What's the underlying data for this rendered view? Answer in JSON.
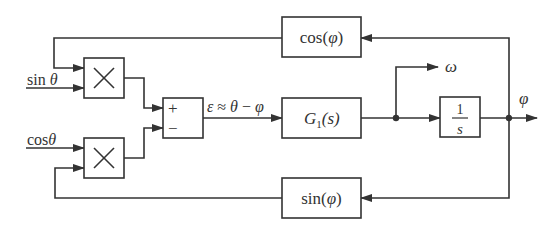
{
  "diagram": {
    "type": "block-diagram",
    "title": "",
    "colors": {
      "line": "#333333",
      "background": "#ffffff"
    },
    "inputs": [
      {
        "id": "in-sin",
        "label_fn": "sin",
        "label_var": "θ"
      },
      {
        "id": "in-cos",
        "label_fn": "cos",
        "label_var": "θ"
      }
    ],
    "blocks": {
      "mult_top": {
        "label": "×"
      },
      "mult_bottom": {
        "label": "×"
      },
      "summer": {
        "plus": "+",
        "minus": "−"
      },
      "error_label": {
        "eps": "ε",
        "approx": " ≈ ",
        "theta": "θ",
        "minus": " − ",
        "phi": "φ"
      },
      "controller": {
        "G": "G",
        "sub": "1",
        "arg": "(s)"
      },
      "integrator": {
        "num": "1",
        "den": "s"
      },
      "cos_fb": {
        "fn": "cos(",
        "var": "φ",
        "close": ")"
      },
      "sin_fb": {
        "fn": "sin(",
        "var": "φ",
        "close": ")"
      }
    },
    "outputs": [
      {
        "id": "omega",
        "label": "ω"
      },
      {
        "id": "phi",
        "label": "φ"
      }
    ],
    "connections": [
      {
        "from": "sinθ",
        "to": "mult_top"
      },
      {
        "from": "cos_fb",
        "to": "mult_top"
      },
      {
        "from": "cosθ",
        "to": "mult_bottom"
      },
      {
        "from": "sin_fb",
        "to": "mult_bottom"
      },
      {
        "from": "mult_top",
        "to": "summer(+)"
      },
      {
        "from": "mult_bottom",
        "to": "summer(−)"
      },
      {
        "from": "summer",
        "to": "controller",
        "label": "ε ≈ θ − φ"
      },
      {
        "from": "controller",
        "to": "integrator"
      },
      {
        "from": "controller",
        "to": "omega"
      },
      {
        "from": "integrator",
        "to": "phi"
      },
      {
        "from": "phi",
        "to": "cos_fb"
      },
      {
        "from": "phi",
        "to": "sin_fb"
      }
    ]
  }
}
